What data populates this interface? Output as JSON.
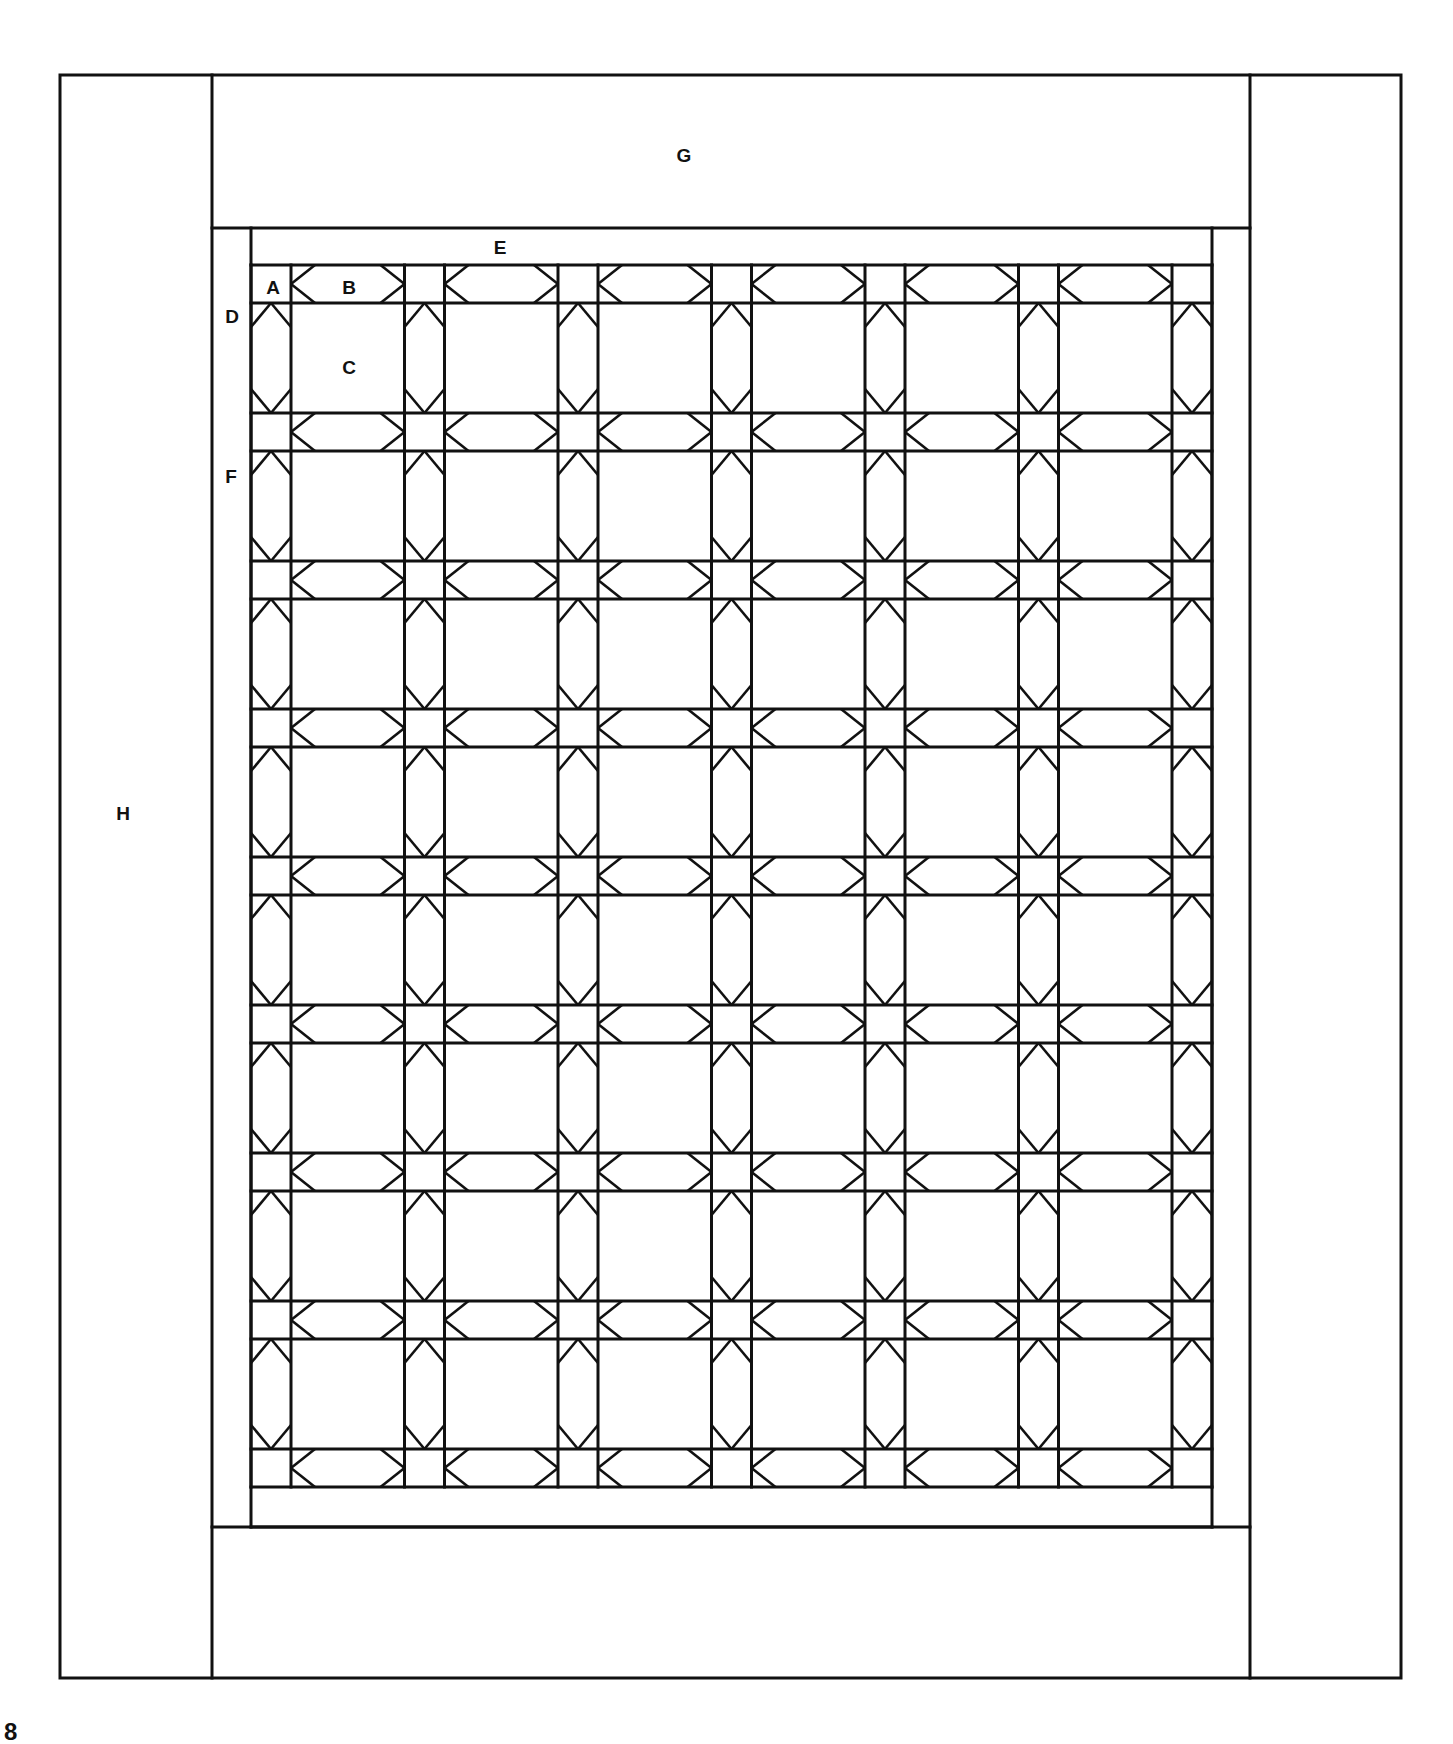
{
  "figure": {
    "page_number": "8",
    "line_color": "#111111",
    "background": "#ffffff"
  },
  "labels": [
    {
      "id": "A",
      "text": "A",
      "x": 273,
      "y": 287,
      "desc": "corner square"
    },
    {
      "id": "B",
      "text": "B",
      "x": 349,
      "y": 287,
      "desc": "sashing strip"
    },
    {
      "id": "C",
      "text": "C",
      "x": 349,
      "y": 367,
      "desc": "plain block"
    },
    {
      "id": "D",
      "text": "D",
      "x": 232,
      "y": 316,
      "desc": "corner triangle"
    },
    {
      "id": "E",
      "text": "E",
      "x": 500,
      "y": 247,
      "desc": "inner border top/bottom"
    },
    {
      "id": "F",
      "text": "F",
      "x": 231,
      "y": 476,
      "desc": "inner border sides"
    },
    {
      "id": "G",
      "text": "G",
      "x": 684,
      "y": 155,
      "desc": "outer border top/bottom"
    },
    {
      "id": "H",
      "text": "H",
      "x": 123,
      "y": 813,
      "desc": "outer border sides"
    }
  ],
  "geometry": {
    "outer": {
      "left": 60,
      "top": 75,
      "right": 1401,
      "bottom": 1678
    },
    "side_dividers": [
      212,
      1250
    ],
    "G_bottom": 228,
    "G_top_of_bottom": 1527,
    "E_inner": {
      "left": 251,
      "right": 1212,
      "top": 228,
      "bottom": 1527
    },
    "grid": {
      "left": 251,
      "top": 265,
      "cols": 6,
      "rows": 8,
      "sash_w": 40,
      "block_w": 113.5,
      "sash_h": 38,
      "block_h": 110
    },
    "notch": 16
  },
  "grid_summary": {
    "blocks_across": 6,
    "blocks_down": 8,
    "total_blocks": 48
  }
}
